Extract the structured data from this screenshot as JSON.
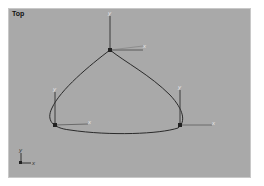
{
  "viewport": {
    "label": "Top",
    "background": "#a9a9a9"
  },
  "spline": {
    "color": "#2a2a2a",
    "vertices": [
      {
        "name": "top",
        "x": 110,
        "y": 50
      },
      {
        "name": "left",
        "x": 55,
        "y": 125
      },
      {
        "name": "right",
        "x": 180,
        "y": 125
      }
    ]
  },
  "gizmos": [
    {
      "name": "top",
      "x_label": "x",
      "y_label": "y"
    },
    {
      "name": "left",
      "x_label": "x",
      "y_label": "y"
    },
    {
      "name": "right",
      "x_label": "x",
      "y_label": "y"
    }
  ],
  "world_axis": {
    "x_label": "x",
    "y_label": "y"
  }
}
